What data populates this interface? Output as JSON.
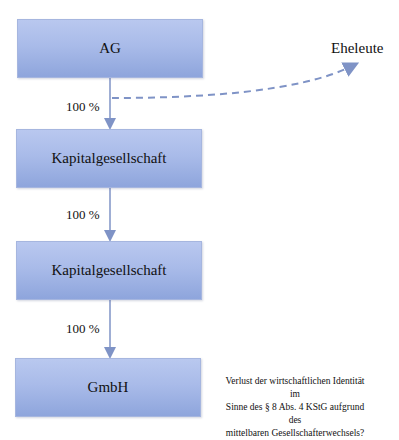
{
  "nodes": [
    {
      "id": "ag",
      "label": "AG"
    },
    {
      "id": "kapital1",
      "label": "Kapitalgesellschaft"
    },
    {
      "id": "kapital2",
      "label": "Kapitalgesellschaft"
    },
    {
      "id": "gmbh",
      "label": "GmbH"
    }
  ],
  "edges": [
    {
      "from": "ag",
      "to": "kapital1",
      "label": "100 %"
    },
    {
      "from": "kapital1",
      "to": "kapital2",
      "label": "100 %"
    },
    {
      "from": "kapital2",
      "to": "gmbh",
      "label": "100 %"
    }
  ],
  "external": {
    "label": "Eheleute"
  },
  "note": {
    "line1": "Verlust der wirtschaftlichen Identität im",
    "line2": "Sinne des § 8 Abs. 4 KStG aufgrund des",
    "line3": "mittelbaren Gesellschafterwechsels?"
  },
  "colors": {
    "box_fill": "#a9bbe9",
    "connector": "#7f93c6"
  }
}
